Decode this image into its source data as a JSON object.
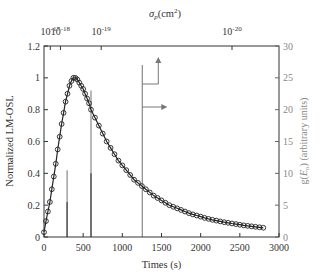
{
  "chart_data": {
    "type": "line",
    "title": "",
    "xlabel": "Times (s)",
    "ylabel": "Normalized LM-OSL",
    "ylabel_right": "g(E_o) (arbitrary units)",
    "xlabel_top": "σ_p(cm²)",
    "xlim": [
      0,
      3000
    ],
    "ylim": [
      0,
      1.2
    ],
    "ylim_right": [
      0,
      30
    ],
    "grid": false,
    "x_ticks": [
      0,
      500,
      1000,
      1500,
      2000,
      2500,
      3000
    ],
    "y_ticks": [
      0,
      0.2,
      0.4,
      0.6,
      0.8,
      1,
      1.2
    ],
    "y_ticks_right": [
      0,
      5,
      10,
      15,
      20,
      25,
      30
    ],
    "top_ticks": [
      {
        "label": "10^-17",
        "base": "10",
        "exp": "-17",
        "t": 80
      },
      {
        "label": "10^-18",
        "base": "10",
        "exp": "-18",
        "t": 210
      },
      {
        "label": "10^-19",
        "base": "10",
        "exp": "-19",
        "t": 730
      },
      {
        "label": "10^-20",
        "base": "10",
        "exp": "-20",
        "t": 2400
      }
    ],
    "series": [
      {
        "name": "LM-OSL data",
        "style": "open-circles",
        "x": [
          0,
          25,
          50,
          75,
          100,
          125,
          150,
          175,
          200,
          225,
          250,
          275,
          300,
          325,
          350,
          375,
          400,
          425,
          450,
          475,
          500,
          525,
          550,
          575,
          600,
          650,
          700,
          750,
          800,
          850,
          900,
          950,
          1000,
          1050,
          1100,
          1150,
          1200,
          1250,
          1300,
          1350,
          1400,
          1450,
          1500,
          1550,
          1600,
          1650,
          1700,
          1750,
          1800,
          1850,
          1900,
          1950,
          2000,
          2050,
          2100,
          2150,
          2200,
          2250,
          2300,
          2350,
          2400,
          2450,
          2500,
          2550,
          2600,
          2650,
          2700,
          2750,
          2800
        ],
        "values": [
          0.03,
          0.1,
          0.16,
          0.22,
          0.3,
          0.38,
          0.46,
          0.55,
          0.63,
          0.71,
          0.78,
          0.85,
          0.9,
          0.95,
          0.98,
          1.0,
          1.0,
          0.99,
          0.97,
          0.95,
          0.93,
          0.9,
          0.87,
          0.84,
          0.8,
          0.75,
          0.7,
          0.65,
          0.6,
          0.56,
          0.52,
          0.48,
          0.45,
          0.42,
          0.39,
          0.36,
          0.34,
          0.32,
          0.3,
          0.28,
          0.26,
          0.245,
          0.23,
          0.215,
          0.2,
          0.19,
          0.18,
          0.17,
          0.16,
          0.15,
          0.142,
          0.135,
          0.128,
          0.12,
          0.114,
          0.108,
          0.103,
          0.098,
          0.093,
          0.089,
          0.085,
          0.081,
          0.077,
          0.073,
          0.07,
          0.067,
          0.064,
          0.061,
          0.058
        ]
      },
      {
        "name": "Fit",
        "style": "solid-line",
        "x": [
          0,
          25,
          50,
          75,
          100,
          125,
          150,
          175,
          200,
          225,
          250,
          275,
          300,
          325,
          350,
          375,
          400,
          425,
          450,
          475,
          500,
          525,
          550,
          575,
          600,
          650,
          700,
          750,
          800,
          850,
          900,
          950,
          1000,
          1050,
          1100,
          1150,
          1200,
          1250,
          1300,
          1350,
          1400,
          1450,
          1500,
          1550,
          1600,
          1650,
          1700,
          1750,
          1800,
          1850,
          1900,
          1950,
          2000,
          2050,
          2100,
          2150,
          2200,
          2250,
          2300,
          2350,
          2400,
          2450,
          2500,
          2550,
          2600,
          2650,
          2700,
          2750,
          2800
        ],
        "values": [
          0.03,
          0.1,
          0.16,
          0.22,
          0.3,
          0.38,
          0.46,
          0.55,
          0.63,
          0.71,
          0.78,
          0.85,
          0.9,
          0.95,
          0.98,
          1.0,
          1.0,
          0.99,
          0.97,
          0.95,
          0.93,
          0.9,
          0.87,
          0.84,
          0.8,
          0.75,
          0.7,
          0.65,
          0.6,
          0.56,
          0.52,
          0.48,
          0.45,
          0.42,
          0.39,
          0.36,
          0.34,
          0.32,
          0.3,
          0.28,
          0.26,
          0.245,
          0.23,
          0.215,
          0.2,
          0.19,
          0.18,
          0.17,
          0.16,
          0.15,
          0.142,
          0.135,
          0.128,
          0.12,
          0.114,
          0.108,
          0.103,
          0.098,
          0.093,
          0.089,
          0.085,
          0.081,
          0.077,
          0.073,
          0.07,
          0.067,
          0.064,
          0.061,
          0.058
        ]
      },
      {
        "name": "g(E_o) distribution",
        "style": "stems",
        "axis": "right",
        "stems": [
          {
            "t": 295,
            "value": 10.5,
            "inner": 5.5
          },
          {
            "t": 600,
            "value": 23.0,
            "inner": 10.0
          },
          {
            "t": 1255,
            "value": 27.0,
            "inner": 0
          }
        ]
      }
    ],
    "annotations": [
      {
        "type": "arrow",
        "direction": "up",
        "meaning": "points to top axis σ_p"
      },
      {
        "type": "arrow",
        "direction": "right",
        "meaning": "points to right axis g(E_o)"
      }
    ],
    "colors": {
      "axis": "#333333",
      "right_axis": "#888888",
      "curve": "#222222",
      "stems": "#777777"
    }
  }
}
